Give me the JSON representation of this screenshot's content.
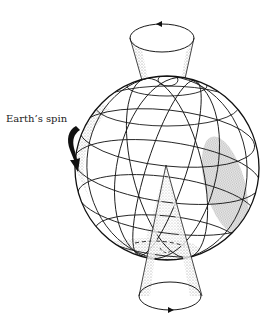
{
  "diagram": {
    "labels": {
      "earth_spin": "Earth’s spin"
    },
    "elements": [
      "globe-with-graticule",
      "upper-precession-cone",
      "lower-precession-cone",
      "spin-direction-arrow"
    ],
    "colors": {
      "line": "#1a1a1a",
      "stipple": "#8c8c8c",
      "background": "#ffffff"
    }
  }
}
